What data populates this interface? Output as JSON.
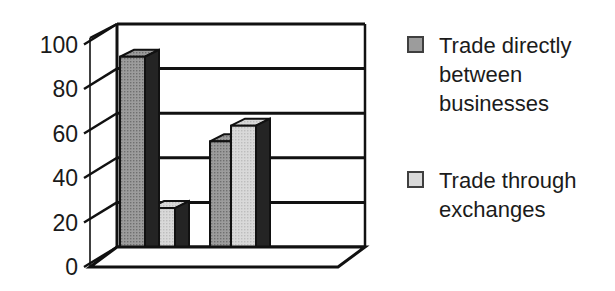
{
  "chart_data": {
    "type": "bar",
    "projection": "3d",
    "title": "",
    "xlabel": "",
    "ylabel": "",
    "categories": [
      "",
      ""
    ],
    "series": [
      {
        "name": "Trade directly between businesses",
        "values": [
          90,
          52
        ],
        "color": "#9c9c9c",
        "dot_color": "#6f6f6f"
      },
      {
        "name": "Trade through exchanges",
        "values": [
          22,
          59
        ],
        "color": "#d9d9d9",
        "dot_color": "#bdbdbd"
      }
    ],
    "yticks": [
      0,
      20,
      40,
      60,
      80,
      100
    ],
    "ylim": [
      0,
      100
    ],
    "grid": true,
    "legend_position": "right",
    "colors": {
      "bar_side": "#242424",
      "outline": "#111111",
      "axis_text": "#1a1a1a",
      "background": "#ffffff"
    }
  }
}
